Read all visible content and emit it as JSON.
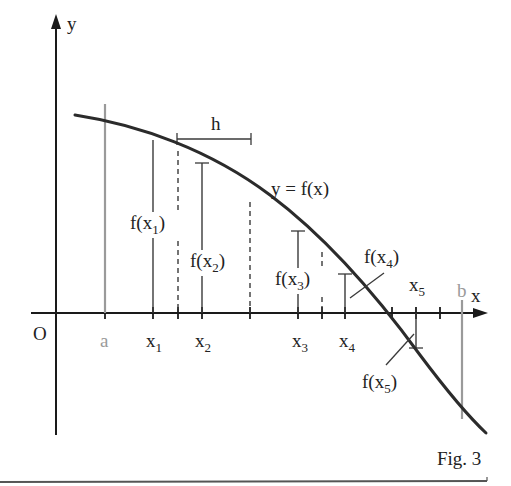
{
  "figure": {
    "caption": "Fig. 3",
    "axes": {
      "x_label": "x",
      "y_label": "y",
      "origin_label": "O"
    },
    "curve_label": "y = f(x)",
    "interval": {
      "a_label": "a",
      "b_label": "b",
      "step_label": "h"
    },
    "nodes": [
      {
        "x_main": "x",
        "x_sub": "1",
        "f_pre": "f(x",
        "f_sub": "1",
        "f_post": ")"
      },
      {
        "x_main": "x",
        "x_sub": "2",
        "f_pre": "f(x",
        "f_sub": "2",
        "f_post": ")"
      },
      {
        "x_main": "x",
        "x_sub": "3",
        "f_pre": "f(x",
        "f_sub": "3",
        "f_post": ")"
      },
      {
        "x_main": "x",
        "x_sub": "4",
        "f_pre": "f(x",
        "f_sub": "4",
        "f_post": ")"
      },
      {
        "x_main": "x",
        "x_sub": "5",
        "f_pre": "f(x",
        "f_sub": "5",
        "f_post": ")"
      }
    ],
    "colors": {
      "ink": "#222222",
      "boundary_gray": "#9a9a9a"
    }
  }
}
